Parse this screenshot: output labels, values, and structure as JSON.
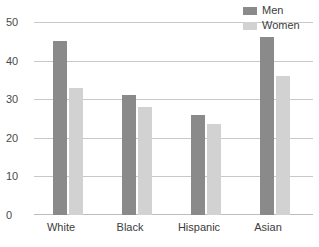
{
  "chart_data": {
    "type": "bar",
    "title": "",
    "subtitle": "",
    "xlabel": "",
    "ylabel": "",
    "categories": [
      "White",
      "Black",
      "Hispanic",
      "Asian"
    ],
    "series": [
      {
        "name": "Men",
        "color": "#8a8a8a",
        "values": [
          45,
          31,
          26,
          46
        ]
      },
      {
        "name": "Women",
        "color": "#d2d2d2",
        "values": [
          33,
          28,
          23.5,
          36
        ]
      }
    ],
    "ylim": [
      0,
      50
    ],
    "yticks": [
      0,
      10,
      20,
      30,
      40,
      50
    ],
    "ytick_labels": [
      "0",
      "10",
      "20",
      "30",
      "40",
      "50"
    ],
    "grid": true,
    "grid_axis": "y",
    "legend_position": "top-right",
    "annotations": []
  },
  "legend": {
    "items": [
      {
        "label": "Men"
      },
      {
        "label": "Women"
      }
    ]
  },
  "axes": {
    "y_labels": [
      "50",
      "40",
      "30",
      "20",
      "10",
      "0"
    ],
    "x_labels": [
      "White",
      "Black",
      "Hispanic",
      "Asian"
    ]
  },
  "colors": {
    "men": "#8a8a8a",
    "women": "#d2d2d2",
    "gridline": "#c8c8c8",
    "text": "#3c3c3c",
    "background": "#ffffff"
  }
}
